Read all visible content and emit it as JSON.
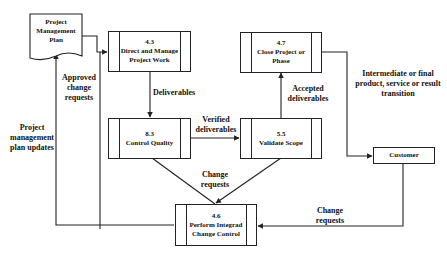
{
  "diagram": {
    "type": "process-flow",
    "document": {
      "name": "Project Management Plan",
      "lines": [
        "Project",
        "Management",
        "Plan"
      ]
    },
    "processes": [
      {
        "id": "4.3",
        "name": "Direct and Manage Project Work",
        "lines": [
          "4.3",
          "Direct and Manage",
          "Project Work"
        ]
      },
      {
        "id": "4.7",
        "name": "Close Project or Phase",
        "lines": [
          "4.7",
          "Close Project or",
          "Phase"
        ]
      },
      {
        "id": "8.3",
        "name": "Control Quality",
        "lines": [
          "8.3",
          "Control Quality"
        ]
      },
      {
        "id": "5.5",
        "name": "Validate Scope",
        "lines": [
          "5.5",
          "Validate Scope"
        ]
      },
      {
        "id": "4.6",
        "name": "Perform Integrad Change Control",
        "lines": [
          "4.6",
          "Perform Integrad",
          "Change Control"
        ]
      }
    ],
    "external": {
      "customer": "Customer"
    },
    "edges": [
      {
        "from": "Project Management Plan",
        "to": "4.3",
        "label": ""
      },
      {
        "from": "4.6",
        "to": "4.3",
        "label": "Approved change requests",
        "lines": [
          "Approved",
          "change",
          "requests"
        ]
      },
      {
        "from": "4.6",
        "to": "Project Management Plan",
        "label": "Project management plan updates",
        "lines": [
          "Project",
          "management",
          "plan updates"
        ]
      },
      {
        "from": "4.3",
        "to": "8.3",
        "label": "Deliverables"
      },
      {
        "from": "8.3",
        "to": "5.5",
        "label": "Verified deliverables",
        "lines": [
          "Verified",
          "deliverables"
        ]
      },
      {
        "from": "5.5",
        "to": "4.7",
        "label": "Accepted deliverables",
        "lines": [
          "Accepted",
          "deliverables"
        ]
      },
      {
        "from": "4.7",
        "to": "Customer",
        "label": "Intermediate or final product, service or result transition",
        "lines": [
          "Intermediate or final",
          "product, service or result",
          "transition"
        ]
      },
      {
        "from": "8.3",
        "to": "4.6",
        "label": "Change requests"
      },
      {
        "from": "5.5",
        "to": "4.6",
        "label": "Change requests",
        "lines": [
          "Change",
          "requests"
        ]
      },
      {
        "from": "Customer",
        "to": "4.6",
        "label": "Change requests",
        "lines": [
          "Change",
          "requests"
        ]
      }
    ]
  }
}
